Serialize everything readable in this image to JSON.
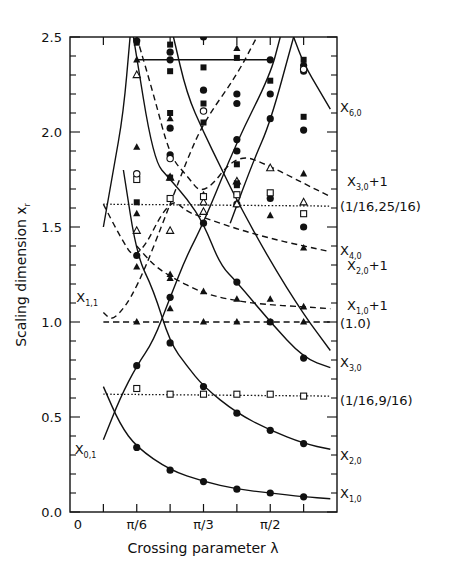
{
  "chart_data": {
    "type": "scatter",
    "title": "",
    "xlabel": "Crossing parameter λ",
    "ylabel": "Scaling dimension x_r",
    "xlim": [
      0,
      2.0944
    ],
    "ylim": [
      0.0,
      2.5
    ],
    "x_units": "pi/12",
    "x_ticks": [
      {
        "k": 0,
        "label": "0"
      },
      {
        "k": 1,
        "label": ""
      },
      {
        "k": 2,
        "label": "π/6"
      },
      {
        "k": 3,
        "label": ""
      },
      {
        "k": 4,
        "label": "π/3"
      },
      {
        "k": 5,
        "label": ""
      },
      {
        "k": 6,
        "label": "π/2"
      },
      {
        "k": 7,
        "label": ""
      }
    ],
    "y_ticks": [
      {
        "v": 0.0,
        "label": "0.0"
      },
      {
        "v": 0.5,
        "label": "0.5"
      },
      {
        "v": 1.0,
        "label": "1.0"
      },
      {
        "v": 1.5,
        "label": "1.5"
      },
      {
        "v": 2.0,
        "label": "2.0"
      },
      {
        "v": 2.5,
        "label": "2.5"
      }
    ],
    "grid": false,
    "legend": "none (curves labelled on right margin)",
    "curves": [
      {
        "name": "X_{1,0}",
        "style": "solid",
        "points": [
          [
            1.0,
            0.66
          ],
          [
            1.5,
            0.46
          ],
          [
            2,
            0.34
          ],
          [
            3,
            0.22
          ],
          [
            4,
            0.16
          ],
          [
            5,
            0.12
          ],
          [
            6,
            0.1
          ],
          [
            7,
            0.08
          ],
          [
            7.8,
            0.07
          ]
        ]
      },
      {
        "name": "X_{0,1}",
        "style": "solid",
        "points": [
          [
            1.0,
            0.38
          ],
          [
            1.5,
            0.6
          ],
          [
            2,
            0.77
          ],
          [
            2.5,
            0.9
          ],
          [
            3,
            1.13
          ],
          [
            3.5,
            1.35
          ],
          [
            4,
            1.52
          ],
          [
            5,
            1.95
          ],
          [
            6,
            2.3
          ],
          [
            6.3,
            2.5
          ]
        ]
      },
      {
        "name": "X_{2,0}",
        "style": "solid",
        "points": [
          [
            1.6,
            1.8
          ],
          [
            2,
            1.35
          ],
          [
            2.5,
            1.17
          ],
          [
            3,
            0.89
          ],
          [
            3.5,
            0.77
          ],
          [
            4,
            0.66
          ],
          [
            5,
            0.52
          ],
          [
            6,
            0.43
          ],
          [
            7,
            0.36
          ],
          [
            7.8,
            0.33
          ]
        ]
      },
      {
        "name": "X_{3,0}",
        "style": "solid",
        "points": [
          [
            1.9,
            2.5
          ],
          [
            2.5,
            1.85
          ],
          [
            3,
            1.75
          ],
          [
            3.5,
            1.65
          ],
          [
            4,
            1.52
          ],
          [
            4.5,
            1.3
          ],
          [
            5,
            1.21
          ],
          [
            6,
            1.0
          ],
          [
            7,
            0.81
          ],
          [
            7.8,
            0.76
          ]
        ]
      },
      {
        "name": "X_{4,0}",
        "style": "solid",
        "points": [
          [
            3.1,
            2.5
          ],
          [
            3.5,
            2.2
          ],
          [
            4,
            2.0
          ],
          [
            4.5,
            1.82
          ],
          [
            5,
            1.64
          ],
          [
            6,
            1.32
          ],
          [
            7,
            1.04
          ],
          [
            7.8,
            0.85
          ]
        ]
      },
      {
        "name": "X_{6,0}",
        "style": "solid",
        "points": [
          [
            6.7,
            2.5
          ],
          [
            7,
            2.36
          ],
          [
            7.5,
            2.21
          ],
          [
            7.8,
            2.12
          ]
        ]
      },
      {
        "name": "X_{5,0} rising",
        "style": "solid",
        "points": [
          [
            4.8,
            1.52
          ],
          [
            5.5,
            1.85
          ],
          [
            6,
            2.05
          ],
          [
            6.7,
            2.5
          ]
        ]
      },
      {
        "name": "X_{1,1} left branch",
        "style": "solid",
        "points": [
          [
            1.0,
            1.5
          ],
          [
            1.3,
            1.8
          ],
          [
            1.6,
            2.1
          ],
          [
            1.8,
            2.5
          ]
        ]
      },
      {
        "name": "X_{1,0}+1",
        "style": "dashed",
        "points": [
          [
            2,
            1.4
          ],
          [
            2.5,
            1.3
          ],
          [
            3,
            1.24
          ],
          [
            4,
            1.15
          ],
          [
            5,
            1.11
          ],
          [
            6,
            1.09
          ],
          [
            7,
            1.08
          ],
          [
            7.8,
            1.07
          ]
        ]
      },
      {
        "name": "X_{2,0}+1",
        "style": "dashed",
        "points": [
          [
            1.0,
            1.62
          ],
          [
            1.5,
            1.45
          ],
          [
            2,
            1.31
          ],
          [
            3,
            1.66
          ],
          [
            3.5,
            1.58
          ],
          [
            4,
            1.55
          ],
          [
            5,
            1.49
          ],
          [
            6,
            1.44
          ],
          [
            7,
            1.4
          ],
          [
            7.8,
            1.37
          ]
        ]
      },
      {
        "name": "X_{3,0}+1",
        "style": "dashed",
        "points": [
          [
            2,
            2.5
          ],
          [
            2.5,
            2.2
          ],
          [
            3,
            1.87
          ],
          [
            3.5,
            1.77
          ],
          [
            4,
            1.66
          ],
          [
            5,
            1.89
          ],
          [
            6,
            1.82
          ],
          [
            7,
            1.73
          ],
          [
            7.8,
            1.66
          ]
        ]
      },
      {
        "name": "X_{1,1}",
        "style": "dashed",
        "points": [
          [
            1.0,
            1.05
          ],
          [
            1.3,
            1.0
          ],
          [
            2,
            1.17
          ],
          [
            3,
            1.62
          ],
          [
            3.5,
            1.85
          ],
          [
            4,
            2.05
          ],
          [
            5,
            2.3
          ],
          [
            5.6,
            2.5
          ]
        ]
      },
      {
        "name": "(1.0)",
        "style": "dashed-flat",
        "points": [
          [
            1.0,
            1.0
          ],
          [
            7.8,
            1.0
          ]
        ]
      },
      {
        "name": "(1/16,25/16)",
        "style": "dotted",
        "points": [
          [
            1.0,
            1.62
          ],
          [
            7.8,
            1.61
          ]
        ]
      },
      {
        "name": "(1/16,9/16)",
        "style": "dotted",
        "points": [
          [
            1.0,
            0.62
          ],
          [
            7.8,
            0.61
          ]
        ]
      },
      {
        "name": "horizontal 2.38",
        "style": "solid-flat",
        "points": [
          [
            2,
            2.38
          ],
          [
            6,
            2.38
          ]
        ]
      }
    ],
    "markers": [
      {
        "shape": "filled-circle",
        "points": [
          [
            2,
            0.34
          ],
          [
            3,
            0.22
          ],
          [
            4,
            0.16
          ],
          [
            5,
            0.12
          ],
          [
            6,
            0.1
          ],
          [
            7,
            0.08
          ],
          [
            2,
            0.77
          ],
          [
            3,
            1.13
          ],
          [
            4,
            1.52
          ],
          [
            5,
            1.21
          ],
          [
            6,
            1.0
          ],
          [
            7,
            0.81
          ],
          [
            3,
            0.89
          ],
          [
            4,
            0.66
          ],
          [
            5,
            0.52
          ],
          [
            6,
            0.43
          ],
          [
            7,
            0.36
          ],
          [
            2,
            1.35
          ],
          [
            3,
            2.02
          ],
          [
            3,
            1.88
          ],
          [
            4,
            2.22
          ],
          [
            5,
            2.2
          ],
          [
            5,
            2.15
          ],
          [
            5,
            1.9
          ],
          [
            6,
            2.38
          ],
          [
            6,
            2.2
          ],
          [
            6,
            2.07
          ],
          [
            7,
            2.01
          ],
          [
            7,
            1.5
          ],
          [
            3,
            2.38
          ],
          [
            3,
            2.42
          ],
          [
            4,
            2.5
          ],
          [
            2,
            2.48
          ],
          [
            5,
            1.62
          ],
          [
            6,
            1.65
          ],
          [
            5,
            1.96
          ],
          [
            7,
            2.32
          ],
          [
            7,
            2.35
          ]
        ]
      },
      {
        "shape": "filled-triangle",
        "points": [
          [
            2,
            1.0
          ],
          [
            4,
            1.0
          ],
          [
            5,
            1.0
          ],
          [
            6,
            1.0
          ],
          [
            7,
            1.0
          ],
          [
            3,
            1.07
          ],
          [
            4,
            1.16
          ],
          [
            5,
            1.12
          ],
          [
            6,
            1.12
          ],
          [
            7,
            1.08
          ],
          [
            2,
            1.29
          ],
          [
            3,
            1.25
          ],
          [
            3,
            1.23
          ],
          [
            2,
            1.92
          ],
          [
            2,
            1.57
          ],
          [
            3,
            2.07
          ],
          [
            4,
            1.67
          ],
          [
            5,
            1.62
          ],
          [
            6,
            1.56
          ],
          [
            7,
            1.39
          ],
          [
            7,
            1.78
          ],
          [
            5,
            2.44
          ],
          [
            2,
            2.38
          ]
        ]
      },
      {
        "shape": "open-triangle",
        "points": [
          [
            2,
            1.48
          ],
          [
            3,
            1.48
          ],
          [
            2,
            2.3
          ],
          [
            3,
            1.76
          ],
          [
            4,
            1.58
          ],
          [
            4,
            1.63
          ],
          [
            5,
            1.74
          ],
          [
            5,
            1.62
          ],
          [
            6,
            1.81
          ],
          [
            7,
            1.63
          ]
        ]
      },
      {
        "shape": "open-square",
        "points": [
          [
            2,
            0.65
          ],
          [
            3,
            0.62
          ],
          [
            4,
            0.62
          ],
          [
            5,
            0.62
          ],
          [
            6,
            0.62
          ],
          [
            7,
            0.61
          ],
          [
            2,
            1.75
          ],
          [
            3,
            1.65
          ],
          [
            4,
            1.66
          ],
          [
            5,
            1.67
          ],
          [
            6,
            1.68
          ],
          [
            7,
            1.57
          ]
        ]
      },
      {
        "shape": "open-circle",
        "points": [
          [
            2,
            1.78
          ],
          [
            3,
            1.86
          ],
          [
            4,
            2.11
          ],
          [
            7,
            2.33
          ]
        ]
      },
      {
        "shape": "filled-square",
        "points": [
          [
            2,
            1.63
          ],
          [
            2,
            2.47
          ],
          [
            3,
            2.1
          ],
          [
            3,
            2.32
          ],
          [
            3,
            2.46
          ],
          [
            3,
            1.76
          ],
          [
            4,
            2.34
          ],
          [
            4,
            2.15
          ],
          [
            4,
            2.05
          ],
          [
            5,
            2.39
          ],
          [
            5,
            1.73
          ],
          [
            5,
            1.72
          ],
          [
            5,
            1.83
          ],
          [
            6,
            2.27
          ],
          [
            7,
            2.38
          ],
          [
            7,
            2.08
          ]
        ]
      }
    ],
    "right_labels": [
      {
        "text": "X",
        "sub": "6,0",
        "suffix": "",
        "v": 2.13
      },
      {
        "text": "X",
        "sub": "3,0",
        "suffix": "+1",
        "v": 1.74
      },
      {
        "text": "(1/16,25/16)",
        "sub": "",
        "suffix": "",
        "v": 1.61
      },
      {
        "text": "X",
        "sub": "4,0",
        "suffix": "",
        "v": 1.38
      },
      {
        "text": "X",
        "sub": "2,0",
        "suffix": "+1",
        "v": 1.3
      },
      {
        "text": "X",
        "sub": "1,0",
        "suffix": "+1",
        "v": 1.09
      },
      {
        "text": "(1.0)",
        "sub": "",
        "suffix": "",
        "v": 0.995
      },
      {
        "text": "X",
        "sub": "3,0",
        "suffix": "",
        "v": 0.79
      },
      {
        "text": "(1/16,9/16)",
        "sub": "",
        "suffix": "",
        "v": 0.59
      },
      {
        "text": "X",
        "sub": "2,0",
        "suffix": "",
        "v": 0.3
      },
      {
        "text": "X",
        "sub": "1,0",
        "suffix": "",
        "v": 0.1
      }
    ],
    "inner_labels": [
      {
        "text": "X",
        "sub": "1,1",
        "k": 0.25,
        "v": 1.13
      },
      {
        "text": "X",
        "sub": "0,1",
        "k": 0.2,
        "v": 0.33
      }
    ]
  }
}
